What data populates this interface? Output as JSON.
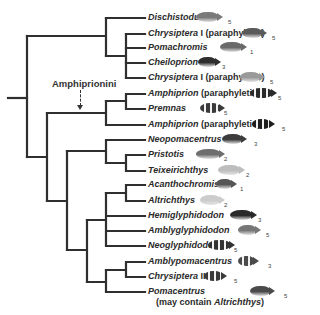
{
  "diagram": {
    "type": "phylogenetic-tree",
    "clade_label": "Amphiprionini",
    "leaves": [
      {
        "genus": "Dischistodus",
        "note": "",
        "note2": "",
        "count": "5",
        "fish_color": "#7a7a7a",
        "fish_style": "plain"
      },
      {
        "genus": "Chrysiptera",
        "note": " I (paraphyletic)",
        "note2": "",
        "count": "5",
        "fish_color": "#5a5a5a",
        "fish_style": "plain"
      },
      {
        "genus": "Pomachromis",
        "note": "",
        "note2": "",
        "count": "1",
        "fish_color": "#6a6a6a",
        "fish_style": "plain"
      },
      {
        "genus": "Cheiloprion",
        "note": "",
        "note2": "",
        "count": "3",
        "fish_color": "#2e2e2e",
        "fish_style": "plain"
      },
      {
        "genus": "Chrysiptera",
        "note": " I (paraphyletic)",
        "note2": "",
        "count": "5",
        "fish_color": "#9a9a9a",
        "fish_style": "plain"
      },
      {
        "genus": "Amphiprion",
        "note": " (paraphyletic)",
        "note2": "",
        "count": "5",
        "fish_color": "#2a2a2a",
        "fish_style": "banded"
      },
      {
        "genus": "Premnas",
        "note": "",
        "note2": "",
        "count": "5",
        "fish_color": "#3a3a3a",
        "fish_style": "banded"
      },
      {
        "genus": "Amphiprion",
        "note": " (paraphyletic)",
        "note2": "",
        "count": "5",
        "fish_color": "#1e1e1e",
        "fish_style": "banded"
      },
      {
        "genus": "Neopomacentrus",
        "note": "",
        "note2": "",
        "count": "3",
        "fish_color": "#3c3c3c",
        "fish_style": "plain"
      },
      {
        "genus": "Pristotis",
        "note": "",
        "note2": "",
        "count": "2",
        "fish_color": "#6e6e6e",
        "fish_style": "plain"
      },
      {
        "genus": "Teixeirichthys",
        "note": "",
        "note2": "",
        "count": "2",
        "fish_color": "#bdbdbd",
        "fish_style": "plain"
      },
      {
        "genus": "Acanthochromis",
        "note": "",
        "note2": "",
        "count": "1",
        "fish_color": "#555555",
        "fish_style": "plain"
      },
      {
        "genus": "Altrichthys",
        "note": "",
        "note2": "",
        "count": "2",
        "fish_color": "#cccccc",
        "fish_style": "plain"
      },
      {
        "genus": "Hemiglyphidodon",
        "note": "",
        "note2": "",
        "count": "3",
        "fish_color": "#2a2a2a",
        "fish_style": "plain"
      },
      {
        "genus": "Amblyglyphidodon",
        "note": "",
        "note2": "",
        "count": "5",
        "fish_color": "#777777",
        "fish_style": "plain"
      },
      {
        "genus": "Neoglyphidodon",
        "note": "",
        "note2": "",
        "count": "5",
        "fish_color": "#333333",
        "fish_style": "banded"
      },
      {
        "genus": "Amblypomacentrus",
        "note": "",
        "note2": "",
        "count": "3",
        "fish_color": "#4a4a4a",
        "fish_style": "banded"
      },
      {
        "genus": "Chrysiptera",
        "note": " II",
        "note2": "",
        "count": "5",
        "fish_color": "#3a3a3a",
        "fish_style": "banded"
      },
      {
        "genus": "Pomacentrus",
        "note": "",
        "note2_prefix": "(may contain ",
        "note2_genus": "Altrichthys",
        "note2_suffix": ")",
        "count": "5",
        "fish_color": "#4a4a4a",
        "fish_style": "plain"
      }
    ]
  },
  "colors": {
    "branch": "#2f2f2f",
    "text": "#2b2b2b"
  }
}
